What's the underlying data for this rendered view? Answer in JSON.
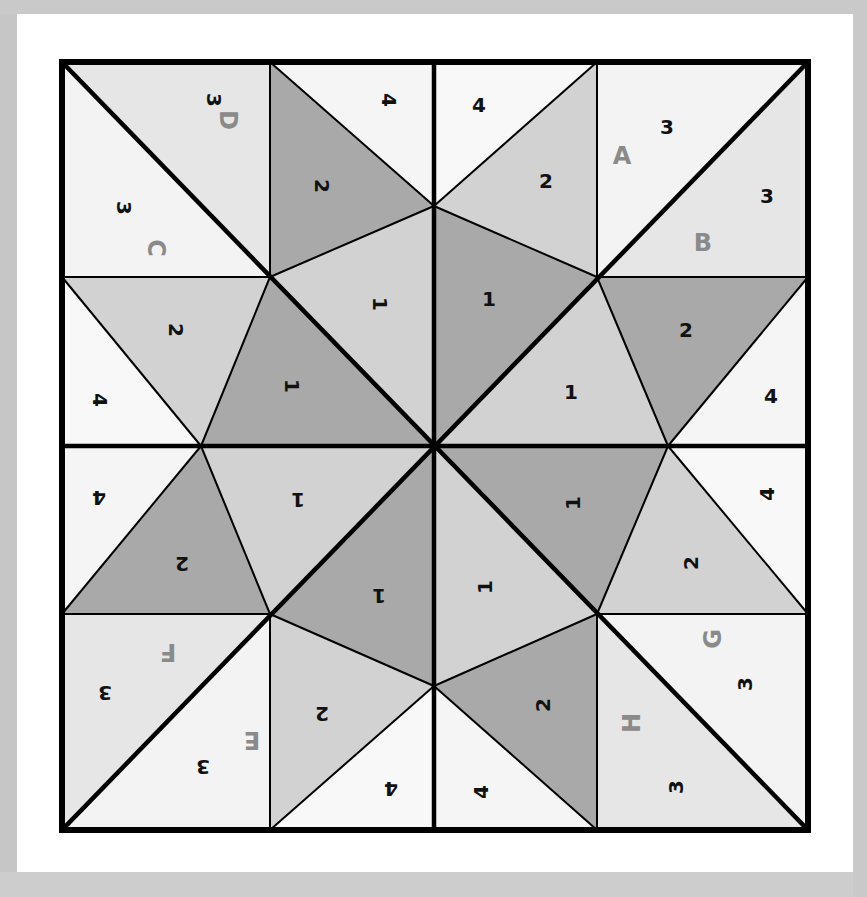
{
  "diagram": {
    "type": "quilt-block-piecing-diagram",
    "colors": {
      "background": "#c8c8c8",
      "mat": "#ffffff",
      "outline": "#000000",
      "fabric_1_dark": "#a9a9a9",
      "fabric_1_light": "#d2d2d2",
      "fabric_2_dark": "#a9a9a9",
      "fabric_2_light": "#d2d2d2",
      "fabric_3_light": "#f3f3f3",
      "fabric_3_mid": "#e6e6e6",
      "fabric_4": "#f7f7f7",
      "letter_color": "#8a8a8a",
      "number_color": "#111111"
    },
    "unit_letters": {
      "A": "A",
      "B": "B",
      "C": "C",
      "D": "D",
      "E": "E",
      "F": "F",
      "G": "G",
      "H": "H"
    },
    "piece_numbers": {
      "one": "1",
      "two": "2",
      "three": "3",
      "four": "4"
    },
    "corner_units": [
      {
        "position": "top-left",
        "letters": [
          "C",
          "D"
        ],
        "pieces": [
          "3",
          "3"
        ]
      },
      {
        "position": "top-right",
        "letters": [
          "A",
          "B"
        ],
        "pieces": [
          "3",
          "3"
        ]
      },
      {
        "position": "bottom-left",
        "letters": [
          "E",
          "F"
        ],
        "pieces": [
          "3",
          "3"
        ]
      },
      {
        "position": "bottom-right",
        "letters": [
          "G",
          "H"
        ],
        "pieces": [
          "3",
          "3"
        ]
      }
    ],
    "edge_units": [
      {
        "position": "top-left-edge",
        "pieces": [
          "4",
          "2",
          "1"
        ]
      },
      {
        "position": "top-right-edge",
        "pieces": [
          "4",
          "2",
          "1"
        ]
      },
      {
        "position": "right-top-edge",
        "pieces": [
          "2",
          "1",
          "4"
        ]
      },
      {
        "position": "right-bottom-edge",
        "pieces": [
          "4",
          "2",
          "1"
        ]
      },
      {
        "position": "bottom-right-edge",
        "pieces": [
          "2",
          "1",
          "4"
        ]
      },
      {
        "position": "bottom-left-edge",
        "pieces": [
          "4",
          "2",
          "1"
        ]
      },
      {
        "position": "left-bottom-edge",
        "pieces": [
          "4",
          "2",
          "1"
        ]
      },
      {
        "position": "left-top-edge",
        "pieces": [
          "4",
          "2",
          "1"
        ]
      }
    ]
  }
}
